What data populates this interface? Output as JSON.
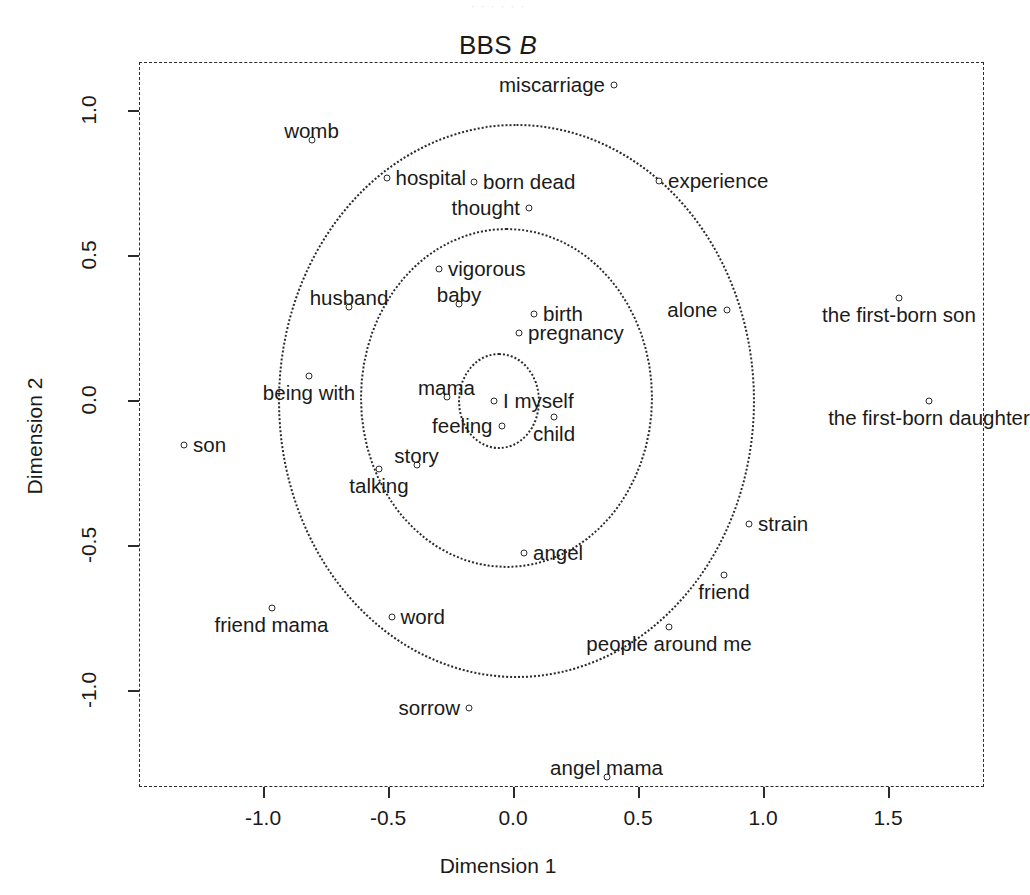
{
  "ghost_top_text": "· · · · · ·",
  "title": {
    "main": "BBS ",
    "italic": "B"
  },
  "axes": {
    "xlabel": "Dimension 1",
    "ylabel": "Dimension 2",
    "xticks": [
      "-1.0",
      "-0.5",
      "0.0",
      "0.5",
      "1.0",
      "1.5"
    ],
    "yticks": [
      "1.0",
      "0.5",
      "0.0",
      "-0.5",
      "-1.0"
    ]
  },
  "chart_data": {
    "type": "scatter",
    "title": "BBS B",
    "xlabel": "Dimension 1",
    "ylabel": "Dimension 2",
    "xlim": [
      -1.5,
      1.88
    ],
    "ylim": [
      -1.44,
      1.16
    ],
    "xtick_values": [
      -1.0,
      -0.5,
      0.0,
      0.5,
      1.0,
      1.5
    ],
    "ytick_values": [
      1.0,
      0.5,
      0.0,
      -0.5,
      -1.0
    ],
    "grid": false,
    "legend": null,
    "marker": "open-circle",
    "annotation_note": "Dotted concentric circles centred near the origin indicate correspondence-analysis distance contours.",
    "rings": [
      {
        "cx": -0.06,
        "cy": 0.0,
        "r": 0.165
      },
      {
        "cx": -0.03,
        "cy": 0.01,
        "r": 0.585
      },
      {
        "cx": 0.01,
        "cy": 0.0,
        "r": 0.955
      }
    ],
    "points": [
      {
        "label": "miscarriage",
        "x": 0.4,
        "y": 1.09,
        "pos": "left"
      },
      {
        "label": "womb",
        "x": -0.81,
        "y": 0.9,
        "pos": "center"
      },
      {
        "label": "hospital",
        "x": -0.51,
        "y": 0.77,
        "pos": "right"
      },
      {
        "label": "born dead",
        "x": -0.16,
        "y": 0.755,
        "pos": "right"
      },
      {
        "label": "experience",
        "x": 0.58,
        "y": 0.76,
        "pos": "right"
      },
      {
        "label": "thought",
        "x": 0.06,
        "y": 0.665,
        "pos": "left"
      },
      {
        "label": "vigorous",
        "x": -0.3,
        "y": 0.455,
        "pos": "right"
      },
      {
        "label": "husband",
        "x": -0.66,
        "y": 0.325,
        "pos": "center"
      },
      {
        "label": "baby",
        "x": -0.22,
        "y": 0.335,
        "pos": "center"
      },
      {
        "label": "birth",
        "x": 0.08,
        "y": 0.3,
        "pos": "right"
      },
      {
        "label": "pregnancy",
        "x": 0.02,
        "y": 0.235,
        "pos": "right"
      },
      {
        "label": "alone",
        "x": 0.85,
        "y": 0.315,
        "pos": "left"
      },
      {
        "label": "the first-born son",
        "x": 1.54,
        "y": 0.355,
        "pos": "below"
      },
      {
        "label": "being with",
        "x": -0.82,
        "y": 0.085,
        "pos": "below"
      },
      {
        "label": "mama",
        "x": -0.27,
        "y": 0.015,
        "pos": "center"
      },
      {
        "label": "I myself",
        "x": -0.08,
        "y": 0.0,
        "pos": "right"
      },
      {
        "label": "the first-born daughter",
        "x": 1.66,
        "y": 0.0,
        "pos": "below"
      },
      {
        "label": "son",
        "x": -1.32,
        "y": -0.15,
        "pos": "right"
      },
      {
        "label": "feeling",
        "x": -0.05,
        "y": -0.085,
        "pos": "left"
      },
      {
        "label": "child",
        "x": 0.16,
        "y": -0.055,
        "pos": "below"
      },
      {
        "label": "story",
        "x": -0.39,
        "y": -0.22,
        "pos": "center"
      },
      {
        "label": "talking",
        "x": -0.54,
        "y": -0.235,
        "pos": "below"
      },
      {
        "label": "strain",
        "x": 0.94,
        "y": -0.425,
        "pos": "right"
      },
      {
        "label": "angel",
        "x": 0.04,
        "y": -0.525,
        "pos": "right"
      },
      {
        "label": "friend",
        "x": 0.84,
        "y": -0.6,
        "pos": "below"
      },
      {
        "label": "friend mama",
        "x": -0.97,
        "y": -0.715,
        "pos": "below"
      },
      {
        "label": "word",
        "x": -0.49,
        "y": -0.745,
        "pos": "right"
      },
      {
        "label": "people around me",
        "x": 0.62,
        "y": -0.78,
        "pos": "below"
      },
      {
        "label": "sorrow",
        "x": -0.18,
        "y": -1.06,
        "pos": "left"
      },
      {
        "label": "angel mama",
        "x": 0.37,
        "y": -1.295,
        "pos": "center"
      }
    ]
  }
}
